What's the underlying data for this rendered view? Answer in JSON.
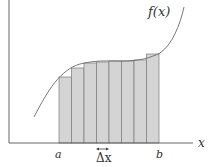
{
  "diagram": {
    "colors": {
      "axis": "#555555",
      "curve": "#6a6a6a",
      "bar_fill": "#d4d4d4",
      "bar_stroke": "#7a7a7a",
      "text": "#333333"
    },
    "labels": {
      "curve": "f(x)",
      "x_axis": "x",
      "a": "a",
      "b": "b",
      "delta_x": "Δx",
      "delta_arrow": "↔"
    },
    "rectangles": {
      "count": 8,
      "x_start": 59,
      "width": 12.5,
      "baseline_y": 143,
      "tops_y": [
        77,
        68,
        63,
        62,
        61,
        61,
        60,
        54
      ]
    }
  },
  "chart_data": {
    "type": "bar",
    "title": "",
    "xlabel": "x",
    "ylabel": "",
    "categories": [
      "1",
      "2",
      "3",
      "4",
      "5",
      "6",
      "7",
      "8"
    ],
    "values": [
      66,
      75,
      80,
      81,
      82,
      82,
      83,
      89
    ],
    "annotations": [
      "f(x)",
      "a",
      "b",
      "Δx"
    ]
  }
}
